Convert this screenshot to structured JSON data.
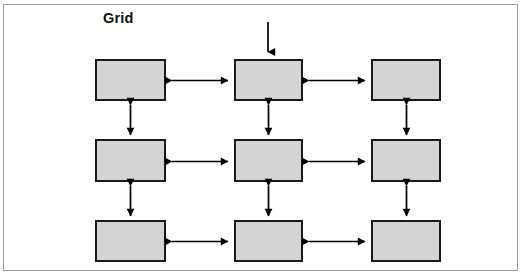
{
  "figure": {
    "title": "Grid",
    "width": 525,
    "height": 277,
    "background_color": "#ffffff",
    "frame": {
      "x": 3,
      "y": 4,
      "width": 515,
      "height": 267,
      "border_color": "#9a9a9a",
      "border_width": 1
    }
  },
  "style": {
    "node_fill": "#d4d4d4",
    "node_border": "#1a1a1a",
    "node_border_width": 2,
    "arrow_color": "#000000",
    "arrow_width": 1.6,
    "title_color": "#111111"
  },
  "diagram": {
    "type": "grid-topology",
    "rows": 3,
    "columns": 3,
    "node_count": 9,
    "nodes": [
      {
        "id": "r1c1",
        "row": 1,
        "col": 1,
        "label": "",
        "x": 95,
        "y": 59,
        "width": 71,
        "height": 42
      },
      {
        "id": "r1c2",
        "row": 1,
        "col": 2,
        "label": "",
        "x": 234,
        "y": 59,
        "width": 69,
        "height": 42
      },
      {
        "id": "r1c3",
        "row": 1,
        "col": 3,
        "label": "",
        "x": 371,
        "y": 59,
        "width": 70,
        "height": 42
      },
      {
        "id": "r2c1",
        "row": 2,
        "col": 1,
        "label": "",
        "x": 95,
        "y": 139,
        "width": 71,
        "height": 43
      },
      {
        "id": "r2c2",
        "row": 2,
        "col": 2,
        "label": "",
        "x": 234,
        "y": 139,
        "width": 69,
        "height": 43
      },
      {
        "id": "r2c3",
        "row": 2,
        "col": 3,
        "label": "",
        "x": 371,
        "y": 139,
        "width": 70,
        "height": 43
      },
      {
        "id": "r3c1",
        "row": 3,
        "col": 1,
        "label": "",
        "x": 95,
        "y": 220,
        "width": 71,
        "height": 42
      },
      {
        "id": "r3c2",
        "row": 3,
        "col": 2,
        "label": "",
        "x": 234,
        "y": 220,
        "width": 69,
        "height": 42
      },
      {
        "id": "r3c3",
        "row": 3,
        "col": 3,
        "label": "",
        "x": 371,
        "y": 220,
        "width": 70,
        "height": 42
      }
    ],
    "horizontal_links": [
      {
        "id": "h-r1-c1c2",
        "from": "r1c1",
        "to": "r1c2",
        "bidirectional": true,
        "x1": 167,
        "x2": 232,
        "y": 80
      },
      {
        "id": "h-r1-c2c3",
        "from": "r1c2",
        "to": "r1c3",
        "bidirectional": true,
        "x1": 305,
        "x2": 369,
        "y": 80
      },
      {
        "id": "h-r2-c1c2",
        "from": "r2c1",
        "to": "r2c2",
        "bidirectional": true,
        "x1": 167,
        "x2": 232,
        "y": 161
      },
      {
        "id": "h-r2-c2c3",
        "from": "r2c2",
        "to": "r2c3",
        "bidirectional": true,
        "x1": 305,
        "x2": 369,
        "y": 161
      },
      {
        "id": "h-r3-c1c2",
        "from": "r3c1",
        "to": "r3c2",
        "bidirectional": true,
        "x1": 167,
        "x2": 232,
        "y": 241
      },
      {
        "id": "h-r3-c2c3",
        "from": "r3c2",
        "to": "r3c3",
        "bidirectional": true,
        "x1": 305,
        "x2": 369,
        "y": 241
      }
    ],
    "vertical_links": [
      {
        "id": "v-c1-r1r2",
        "from": "r1c1",
        "to": "r2c1",
        "bidirectional": true,
        "x": 130,
        "y1": 102,
        "y2": 137
      },
      {
        "id": "v-c2-r1r2",
        "from": "r1c2",
        "to": "r2c2",
        "bidirectional": true,
        "x": 268,
        "y1": 102,
        "y2": 137
      },
      {
        "id": "v-c3-r1r2",
        "from": "r1c3",
        "to": "r2c3",
        "bidirectional": true,
        "x": 406,
        "y1": 102,
        "y2": 137
      },
      {
        "id": "v-c1-r2r3",
        "from": "r2c1",
        "to": "r3c1",
        "bidirectional": true,
        "x": 130,
        "y1": 183,
        "y2": 218
      },
      {
        "id": "v-c2-r2r3",
        "from": "r2c2",
        "to": "r3c2",
        "bidirectional": true,
        "x": 268,
        "y1": 183,
        "y2": 218
      },
      {
        "id": "v-c3-r2r3",
        "from": "r2c3",
        "to": "r3c3",
        "bidirectional": true,
        "x": 406,
        "y1": 183,
        "y2": 218
      }
    ],
    "external_links": [
      {
        "id": "in-top",
        "from": "external",
        "to": "r1c2",
        "bidirectional": false,
        "direction": "down",
        "x": 268,
        "y1": 22,
        "y2": 57
      }
    ]
  }
}
